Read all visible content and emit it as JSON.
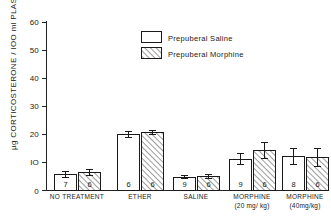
{
  "chart_data": {
    "type": "bar",
    "title": "",
    "subtitle": "",
    "xlabel": "",
    "ylabel": "µg CORTICOSTERONE / IOO ml PLASMA",
    "ylim": [
      0,
      60
    ],
    "ytick_labels": [
      "0",
      "IO",
      "20",
      "30",
      "40",
      "50",
      "60"
    ],
    "ytick_values": [
      0,
      10,
      20,
      30,
      40,
      50,
      60
    ],
    "grid": false,
    "legend_position": "upper-center",
    "categories": [
      "NO TREATMENT",
      "ETHER",
      "SALINE",
      "MORPHINE",
      "MORPHINE"
    ],
    "category_sublabels": [
      "",
      "",
      "",
      "(20 mg/ kg)",
      "(40mg/kg)"
    ],
    "series": [
      {
        "name": "Prepuberal Saline",
        "fill": "open",
        "values": [
          5.6,
          19.8,
          4.8,
          11.1,
          12.1
        ],
        "errors": [
          1.0,
          1.1,
          0.6,
          2.0,
          3.0
        ],
        "n": [
          "7",
          "6",
          "9",
          "9",
          "8"
        ]
      },
      {
        "name": "Prepuberal Morphine",
        "fill": "hatched",
        "values": [
          6.4,
          20.8,
          5.0,
          14.3,
          11.8
        ],
        "errors": [
          1.1,
          0.7,
          0.6,
          2.8,
          3.1
        ],
        "n": [
          "6",
          "6",
          "6",
          "6",
          "6"
        ]
      }
    ]
  },
  "legend": {
    "items": [
      {
        "label": "Prepuberal  Saline",
        "swatch": "open-rect-swatch"
      },
      {
        "label": "Prepuberal  Morphine",
        "swatch": "hatched-rect-swatch"
      }
    ]
  },
  "colors": {
    "ink": "#1a1a1a",
    "background": "#ffffff",
    "hatch": "#555555"
  }
}
